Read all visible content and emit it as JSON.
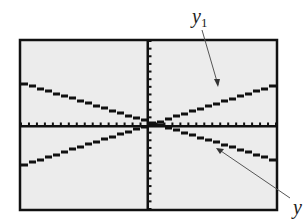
{
  "chart_data": {
    "type": "line",
    "title": "",
    "xlabel": "",
    "ylabel": "",
    "xlim": [
      -16,
      16
    ],
    "ylim": [
      -11,
      11
    ],
    "grid": false,
    "axes": {
      "x_tick_step": 1,
      "y_tick_step": 1
    },
    "style": "graphing-calculator screen, pixelated lines, no numeric tick labels",
    "series": [
      {
        "name": "y1",
        "x": [
          -16,
          16
        ],
        "y": [
          -5.2,
          5.4
        ],
        "description": "increasing line"
      },
      {
        "name": "y2",
        "x": [
          -16,
          16
        ],
        "y": [
          5.4,
          -4.8
        ],
        "description": "decreasing line"
      }
    ],
    "annotations": [
      {
        "text": "y1",
        "subscript": "1",
        "arrow_to": "increasing line (upper right)"
      },
      {
        "text": "y2",
        "subscript": "2",
        "arrow_to": "decreasing line (lower right)",
        "note": "label partially cut off at right edge"
      }
    ],
    "intersection_approx": [
      0.4,
      0.8
    ]
  },
  "labels": {
    "y1_base": "y",
    "y1_sub": "1",
    "y2_base": "y",
    "y2_sub": ""
  },
  "colors": {
    "screen_bg": "#ececec",
    "frame": "#111111",
    "ink": "#111111",
    "arrow": "#555555"
  }
}
